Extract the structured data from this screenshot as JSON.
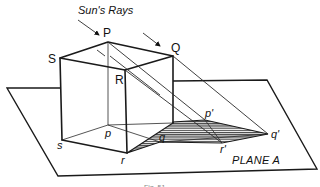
{
  "figure": {
    "title": "Sun's Rays",
    "plane_label": "PLANE A",
    "caption": "Fig. 51",
    "vertices_top": {
      "P": "P",
      "Q": "Q",
      "R": "R",
      "S": "S"
    },
    "vertices_bottom": {
      "p": "p",
      "q": "q",
      "r": "r",
      "s": "s"
    },
    "shadow_points": {
      "p_prime": "p'",
      "q_prime": "q'",
      "r_prime": "r'"
    },
    "colors": {
      "line": "#1a1a1a",
      "background": "#ffffff"
    }
  }
}
